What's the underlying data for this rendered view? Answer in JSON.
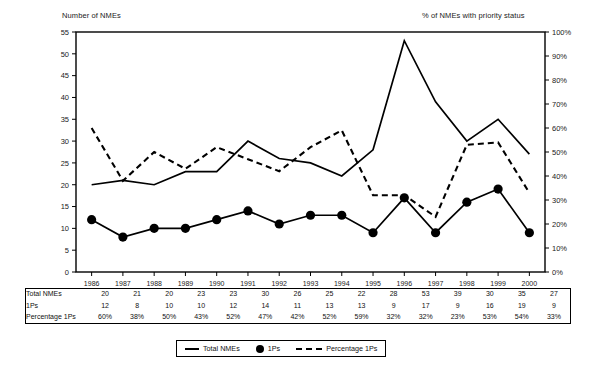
{
  "labels": {
    "left_axis_title": "Number of NMEs",
    "right_axis_title": "% of NMEs with priority status"
  },
  "legend": {
    "items": [
      {
        "label": "Total NMEs",
        "marker": "solid-line",
        "color": "#000000"
      },
      {
        "label": "1Ps",
        "marker": "filled-circle",
        "color": "#000000"
      },
      {
        "label": "Percentage 1Ps",
        "marker": "dashed-line",
        "color": "#000000"
      }
    ]
  },
  "table": {
    "rows": [
      {
        "label": "Total NMEs",
        "values": [
          "20",
          "21",
          "20",
          "23",
          "23",
          "30",
          "26",
          "25",
          "22",
          "28",
          "53",
          "39",
          "30",
          "35",
          "27"
        ]
      },
      {
        "label": "1Ps",
        "values": [
          "12",
          "8",
          "10",
          "10",
          "12",
          "14",
          "11",
          "13",
          "13",
          "9",
          "17",
          "9",
          "16",
          "19",
          "9"
        ]
      },
      {
        "label": "Percentage 1Ps",
        "values": [
          "60%",
          "38%",
          "50%",
          "43%",
          "52%",
          "47%",
          "42%",
          "52%",
          "59%",
          "32%",
          "32%",
          "23%",
          "53%",
          "54%",
          "33%"
        ]
      }
    ]
  },
  "chart_data": {
    "type": "line",
    "title": "",
    "xlabel": "",
    "ylabel": "Number of NMEs",
    "y2label": "% of NMEs with priority status",
    "categories": [
      "1986",
      "1987",
      "1988",
      "1989",
      "1990",
      "1991",
      "1992",
      "1993",
      "1994",
      "1995",
      "1996",
      "1997",
      "1998",
      "1999",
      "2000"
    ],
    "ylim": [
      0,
      55
    ],
    "yticks": [
      0,
      5,
      10,
      15,
      20,
      25,
      30,
      35,
      40,
      45,
      50,
      55
    ],
    "y2lim": [
      0,
      100
    ],
    "y2ticks": [
      "0%",
      "10%",
      "20%",
      "30%",
      "40%",
      "50%",
      "60%",
      "70%",
      "80%",
      "90%",
      "100%"
    ],
    "grid": false,
    "legend_position": "bottom",
    "series": [
      {
        "name": "Total NMEs",
        "axis": "left",
        "style": "solid",
        "marker": "none",
        "color": "#000000",
        "values": [
          20,
          21,
          20,
          23,
          23,
          30,
          26,
          25,
          22,
          28,
          53,
          39,
          30,
          35,
          27
        ]
      },
      {
        "name": "1Ps",
        "axis": "left",
        "style": "solid",
        "marker": "filled-circle",
        "color": "#000000",
        "values": [
          12,
          8,
          10,
          10,
          12,
          14,
          11,
          13,
          13,
          9,
          17,
          9,
          16,
          19,
          9
        ]
      },
      {
        "name": "Percentage 1Ps",
        "axis": "right",
        "style": "dashed",
        "marker": "none",
        "color": "#000000",
        "values": [
          60,
          38,
          50,
          43,
          52,
          47,
          42,
          52,
          59,
          32,
          32,
          23,
          53,
          54,
          33
        ]
      }
    ]
  }
}
